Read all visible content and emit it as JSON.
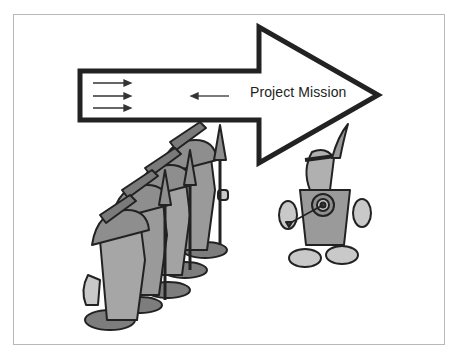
{
  "slide": {
    "arrow_label": "Project Mission",
    "colors": {
      "outline": "#222222",
      "figure_fill": "#9a9a9a",
      "figure_light": "#c9c9c9",
      "frame_border": "#b8b8b8",
      "background": "#ffffff"
    },
    "icons": {
      "small_arrows_right_count": 3,
      "small_arrow_left_count": 1
    },
    "figures": {
      "soldiers": {
        "count": 4,
        "description": "cartoon soldiers with helmets and spears marching toward arrow"
      },
      "target_person": {
        "description": "nervous cartoon figure with feather headband and bullseye target on chest, arrow striking target"
      }
    }
  }
}
